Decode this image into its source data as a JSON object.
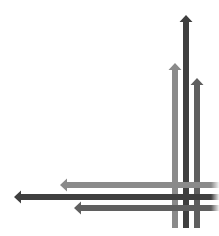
{
  "graphic": {
    "description": "Crossing arrows illustration",
    "colors": {
      "light": "#8a8a8a",
      "dark": "#3f3f3f",
      "medium": "#5f5f5f"
    },
    "vertical_arrows": [
      {
        "name": "light",
        "x": 175,
        "top": 63,
        "bottom": 228,
        "width": 6
      },
      {
        "name": "dark",
        "x": 186,
        "top": 15,
        "bottom": 228,
        "width": 6
      },
      {
        "name": "medium",
        "x": 197,
        "top": 78,
        "bottom": 228,
        "width": 6
      }
    ],
    "horizontal_arrows": [
      {
        "name": "light",
        "y": 185,
        "left": 60,
        "right": 219,
        "width": 6
      },
      {
        "name": "dark",
        "y": 197,
        "left": 14,
        "right": 219,
        "width": 6
      },
      {
        "name": "medium",
        "y": 208,
        "left": 74,
        "right": 219,
        "width": 6
      }
    ]
  }
}
